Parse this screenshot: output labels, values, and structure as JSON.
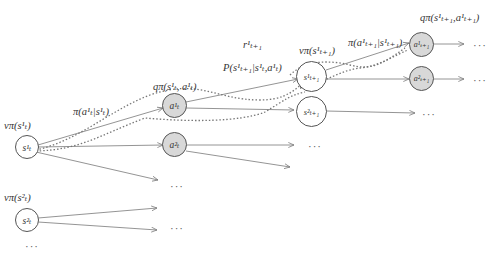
{
  "diagram": {
    "colors": {
      "edge": "#777777",
      "state_fill": "#ffffff",
      "action_fill": "#d8d8d8",
      "node_border": "#555555",
      "text": "#333333"
    },
    "labels": {
      "v_s1": "vπ(s¹ₜ)",
      "v_s2": "vπ(s²ₜ)",
      "pi_at": "π(a¹ₜ|s¹ₜ)",
      "q_st_at": "qπ(s¹ₜ, a¹ₜ)",
      "r_t1": "r¹ₜ₊₁",
      "P_trans": "P(s¹ₜ₊₁|s¹ₜ,a¹ₜ)",
      "v_st1": "vπ(s¹ₜ₊₁)",
      "pi_at1": "π(a¹ₜ₊₁|s¹ₜ₊₁)",
      "q_st1_at1": "qπ(s¹ₜ₊₁,a¹ₜ₊₁)"
    },
    "nodes": {
      "s1_t": "s¹ₜ",
      "s2_t": "s²ₜ",
      "a1_t": "a¹ₜ",
      "a2_t": "a²ₜ",
      "s1_t1": "s¹ₜ₊₁",
      "s2_t1": "s²ₜ₊₁",
      "a1_t1": "a¹ₜ₊₁",
      "a2_t1": "a²ₜ₊₁"
    },
    "ellipsis": "···"
  }
}
